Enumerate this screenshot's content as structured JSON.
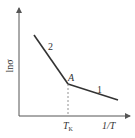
{
  "diagram": {
    "y_axis_label": "lnσ",
    "x_axis_label": "1/T",
    "x_tick_label_main": "T",
    "x_tick_label_sub": "K",
    "point_label": "A",
    "line_labels": [
      "2",
      "1"
    ],
    "colors": {
      "line": "#333333",
      "axis": "#555555",
      "dashed": "#777777",
      "background": "#ffffff"
    }
  }
}
